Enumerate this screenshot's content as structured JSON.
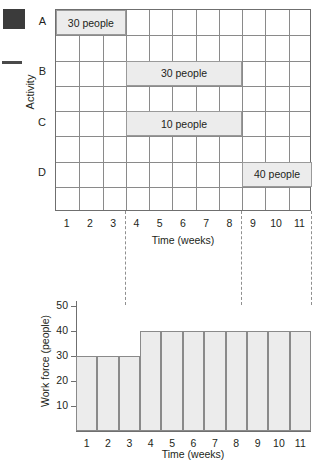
{
  "figure": {
    "marginalia": {
      "square_color": "#3b3b3b",
      "dash_color": "#4a4a4a"
    }
  },
  "gantt": {
    "y_axis_title": "Activity",
    "x_axis_title": "Time (weeks)",
    "activities": [
      "A",
      "B",
      "C",
      "D"
    ],
    "weeks": [
      "1",
      "2",
      "3",
      "4",
      "5",
      "6",
      "7",
      "8",
      "9",
      "10",
      "11"
    ],
    "rows": 8,
    "columns": 11,
    "bars": [
      {
        "activity": "A",
        "label": "30 people",
        "people": 30,
        "start_week": 1,
        "end_week": 3,
        "row": 1
      },
      {
        "activity": "B",
        "label": "30 people",
        "people": 30,
        "start_week": 4,
        "end_week": 8,
        "row": 3
      },
      {
        "activity": "C",
        "label": "10 people",
        "people": 10,
        "start_week": 4,
        "end_week": 8,
        "row": 5
      },
      {
        "activity": "D",
        "label": "40 people",
        "people": 40,
        "start_week": 9,
        "end_week": 11,
        "row": 7
      }
    ],
    "bar_fill": "#ececec",
    "grid_color": "#8a8a8a",
    "dashed_markers": [
      3,
      8,
      11
    ]
  },
  "histogram": {
    "y_axis_title": "Work force (people)",
    "x_axis_title": "Time (weeks)",
    "y_ticks": [
      "10",
      "20",
      "30",
      "40",
      "50"
    ],
    "weeks": [
      "1",
      "2",
      "3",
      "4",
      "5",
      "6",
      "7",
      "8",
      "9",
      "10",
      "11"
    ],
    "bar_fill": "#ececec"
  },
  "chart_data": [
    {
      "type": "bar",
      "name": "activity-schedule-gantt",
      "title": "",
      "xlabel": "Time (weeks)",
      "ylabel": "Activity",
      "orientation": "horizontal",
      "categories": [
        "A",
        "B",
        "C",
        "D"
      ],
      "bars": [
        {
          "category": "A",
          "start": 0,
          "end": 3,
          "value": 30,
          "label": "30 people"
        },
        {
          "category": "B",
          "start": 3,
          "end": 8,
          "value": 30,
          "label": "30 people"
        },
        {
          "category": "C",
          "start": 3,
          "end": 8,
          "value": 10,
          "label": "10 people"
        },
        {
          "category": "D",
          "start": 8,
          "end": 11,
          "value": 40,
          "label": "40 people"
        }
      ],
      "xlim": [
        0,
        11
      ],
      "xticks": [
        1,
        2,
        3,
        4,
        5,
        6,
        7,
        8,
        9,
        10,
        11
      ],
      "grid": true,
      "legend": "none"
    },
    {
      "type": "bar",
      "name": "work-force-histogram",
      "title": "",
      "xlabel": "Time (weeks)",
      "ylabel": "Work force (people)",
      "categories": [
        "1",
        "2",
        "3",
        "4",
        "5",
        "6",
        "7",
        "8",
        "9",
        "10",
        "11"
      ],
      "values": [
        30,
        30,
        30,
        40,
        40,
        40,
        40,
        40,
        40,
        40,
        40
      ],
      "ylim": [
        0,
        52
      ],
      "yticks": [
        10,
        20,
        30,
        40,
        50
      ],
      "grid": false,
      "legend": "none"
    }
  ]
}
